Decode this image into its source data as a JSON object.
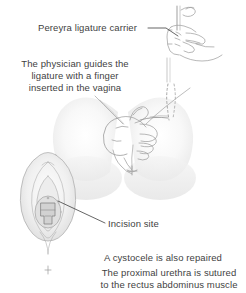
{
  "figure": {
    "kind": "medical-illustration",
    "background_color": "#ffffff",
    "ink_color": "#8e8e8e",
    "text_color": "#3f3f3f",
    "leader_line_color": "#4a4a4a"
  },
  "labels": {
    "carrier": "Pereyra ligature carrier",
    "incision": "Incision site"
  },
  "paragraphs": {
    "physician": [
      "The physician guides the",
      "ligature with a finger",
      "inserted in the vagina"
    ],
    "cystocele": [
      "A cystocele is also repaired"
    ],
    "urethra": [
      "The proximal urethra is sutured",
      "to the rectus abdominus muscle"
    ]
  },
  "illustrations": {
    "hand_with_carrier": "hand gripping vertical ligature carrier instrument",
    "pelvis_with_hand": "lower torso and thighs with hand inserted in vagina and dashed suture path",
    "vulvar_inset": "vulvar view showing incision site"
  }
}
